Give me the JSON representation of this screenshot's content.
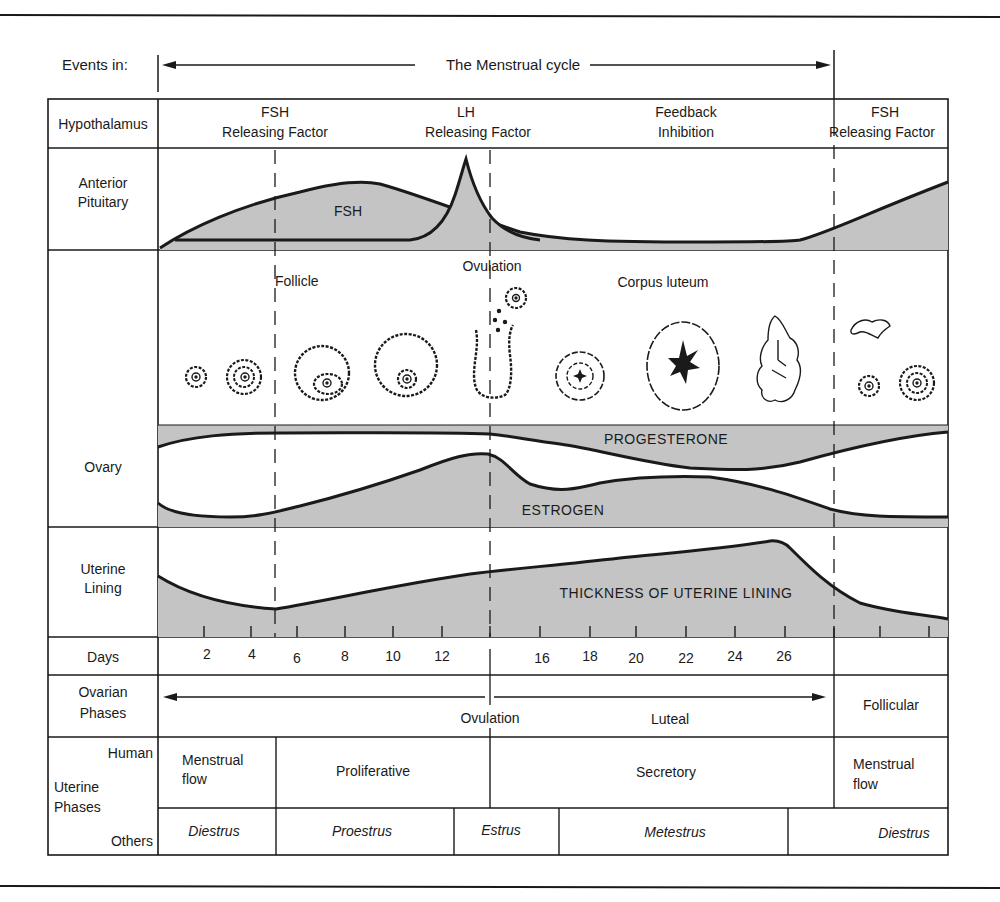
{
  "header": {
    "events_label": "Events in:",
    "cycle_label": "The Menstrual cycle"
  },
  "rows": {
    "hypothalamus": "Hypothalamus",
    "anterior_pituitary": [
      "Anterior",
      "Pituitary"
    ],
    "ovary": "Ovary",
    "uterine_lining": [
      "Uterine",
      "Lining"
    ],
    "days": "Days",
    "ovarian_phases": [
      "Ovarian",
      "Phases"
    ],
    "uterine_phases": {
      "human": "Human",
      "uterine": "Uterine",
      "phases": "Phases",
      "others": "Others"
    }
  },
  "hypothalamus": {
    "fsh_rf_1": [
      "FSH",
      "Releasing Factor"
    ],
    "lh_rf": [
      "LH",
      "Releasing Factor"
    ],
    "feedback": [
      "Feedback",
      "Inhibition"
    ],
    "fsh_rf_2": [
      "FSH",
      "Releasing Factor"
    ]
  },
  "pituitary": {
    "fsh_label": "FSH"
  },
  "ovary_stage_labels": {
    "follicle": "Follicle",
    "ovulation": "Ovulation",
    "corpus_luteum": "Corpus luteum"
  },
  "hormone_labels": {
    "progesterone": "PROGESTERONE",
    "estrogen": "ESTROGEN",
    "uterine_thickness": "THICKNESS OF UTERINE LINING"
  },
  "days": [
    "2",
    "4",
    "6",
    "8",
    "10",
    "12",
    "16",
    "18",
    "20",
    "22",
    "24",
    "26"
  ],
  "ovarian_phases": {
    "ovulation": "Ovulation",
    "luteal": "Luteal",
    "follicular": "Follicular"
  },
  "human_uterine_phases": {
    "menstrual_flow_1": [
      "Menstrual",
      "flow"
    ],
    "proliferative": "Proliferative",
    "secretory": "Secretory",
    "menstrual_flow_2": [
      "Menstrual",
      "flow"
    ]
  },
  "other_phases": [
    "Diestrus",
    "Proestrus",
    "Estrus",
    "Metestrus",
    "Diestrus"
  ],
  "colors": {
    "ink": "#1a1a1a",
    "fill_gray": "#c4c4c4",
    "background": "#ffffff"
  }
}
